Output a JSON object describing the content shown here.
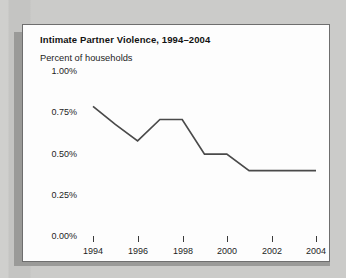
{
  "card": {
    "title": "Intimate Partner Violence, 1994–2004",
    "subtitle": "Percent of households"
  },
  "axis": {
    "y_ticks": [
      "1.00%",
      "0.75%",
      "0.50%",
      "0.25%",
      "0.00%"
    ],
    "x_ticks": [
      "1994",
      "1996",
      "1998",
      "2000",
      "2002",
      "2004"
    ]
  },
  "colors": {
    "line": "#4a4a4a",
    "text": "#1d1d1d",
    "card_background": "#fdfdfd",
    "card_border": "#6e6e6e",
    "page_background": "#c9c9c7",
    "shadow": "#9a9a98"
  },
  "chart_data": {
    "type": "line",
    "title": "Intimate Partner Violence, 1994–2004",
    "subtitle": "Percent of households",
    "xlabel": "",
    "ylabel": "Percent of households",
    "x": [
      1994,
      1995,
      1996,
      1997,
      1998,
      1999,
      2000,
      2001,
      2002,
      2003,
      2004
    ],
    "series": [
      {
        "name": "Percent of households",
        "values": [
          0.78,
          0.67,
          0.57,
          0.7,
          0.7,
          0.49,
          0.49,
          0.39,
          0.39,
          0.39,
          0.39
        ]
      }
    ],
    "xlim": [
      1994,
      2004
    ],
    "ylim": [
      0.0,
      1.0
    ],
    "y_tick_values": [
      1.0,
      0.75,
      0.5,
      0.25,
      0.0
    ],
    "y_tick_labels": [
      "1.00%",
      "0.75%",
      "0.50%",
      "0.25%",
      "0.00%"
    ],
    "x_tick_values": [
      1994,
      1996,
      1998,
      2000,
      2002,
      2004
    ],
    "x_tick_labels": [
      "1994",
      "1996",
      "1998",
      "2000",
      "2002",
      "2004"
    ],
    "units": "percent",
    "grid": false,
    "legend": false,
    "axis_lines": false
  }
}
